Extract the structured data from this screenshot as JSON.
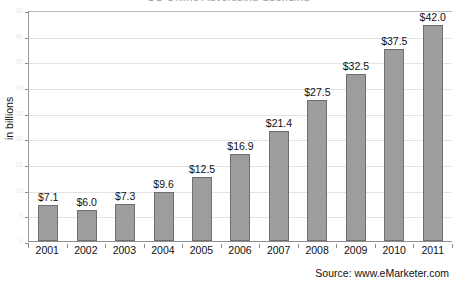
{
  "chart_data": {
    "type": "bar",
    "title": "US Online Advertising Spending",
    "title_clipped": true,
    "xlabel": "",
    "ylabel": "in billions",
    "categories": [
      "2001",
      "2002",
      "2003",
      "2004",
      "2005",
      "2006",
      "2007",
      "2008",
      "2009",
      "2010",
      "2011"
    ],
    "values": [
      7.1,
      6.0,
      7.3,
      9.6,
      12.5,
      16.9,
      21.4,
      27.5,
      32.5,
      37.5,
      42.0
    ],
    "data_labels": [
      "$7.1",
      "$6.0",
      "$7.3",
      "$9.6",
      "$12.5",
      "$16.9",
      "$21.4",
      "$27.5",
      "$32.5",
      "$37.5",
      "$42.0"
    ],
    "ylim": [
      0,
      45
    ],
    "ytick_values": [
      0,
      5,
      10,
      15,
      20,
      25,
      30,
      35,
      40,
      45
    ],
    "ytick_labels": [
      "0",
      "5",
      "10",
      "15",
      "20",
      "25",
      "30",
      "35",
      "40",
      "45"
    ],
    "grid": true,
    "legend": false,
    "bar_color": "#9d9d9d",
    "bar_edge_color": "#6f6f6f",
    "grid_color": "#e3e3e3",
    "axis_color": "#8e8e8e"
  },
  "source": {
    "label": "Source:  www.eMarketer.com"
  }
}
